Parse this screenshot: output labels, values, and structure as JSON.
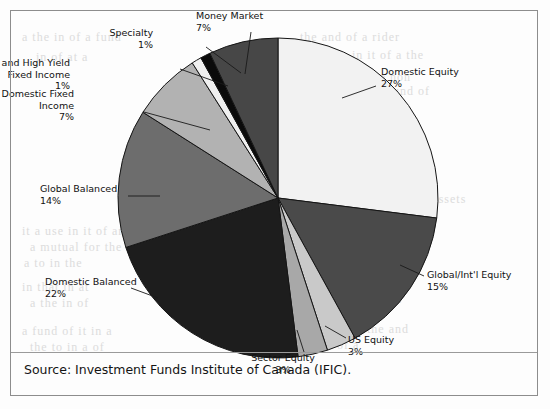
{
  "figure": {
    "source_caption": "Source: Investment Funds Institute of Canada (IFIC).",
    "background_color": "#fdfdfd",
    "frame_color": "#8d8d8d",
    "text_color": "#111111"
  },
  "bleed_text": [
    {
      "text": "the and of a rider",
      "x": 300,
      "y": 30
    },
    {
      "text": "in it of a the",
      "x": 352,
      "y": 48
    },
    {
      "text": "for it and a the non",
      "x": 300,
      "y": 70
    },
    {
      "text": "it the a mutual fund of",
      "x": 300,
      "y": 84
    },
    {
      "text": "the non and are",
      "x": 310,
      "y": 98
    },
    {
      "text": "able of in a an to",
      "x": 300,
      "y": 118
    },
    {
      "text": "that of a mutual funds",
      "x": 300,
      "y": 132
    },
    {
      "text": "a mutual of to a the",
      "x": 296,
      "y": 152
    },
    {
      "text": "a and the in of an",
      "x": 300,
      "y": 166
    },
    {
      "text": "Figure 1 Mutual Fund Assets",
      "x": 300,
      "y": 192
    },
    {
      "text": "in the for a year in",
      "x": 300,
      "y": 206
    },
    {
      "text": "with a percent",
      "x": 300,
      "y": 226
    },
    {
      "text": "for a funds the",
      "x": 300,
      "y": 240
    },
    {
      "text": "a mutual of",
      "x": 300,
      "y": 254
    },
    {
      "text": "in a the",
      "x": 310,
      "y": 268
    },
    {
      "text": "sample funds of a",
      "x": 300,
      "y": 292
    },
    {
      "text": "in that in the",
      "x": 300,
      "y": 306
    },
    {
      "text": "a fund at of the and",
      "x": 296,
      "y": 322
    },
    {
      "text": "the in of a",
      "x": 300,
      "y": 338
    },
    {
      "text": "it a use in it of an",
      "x": 22,
      "y": 224
    },
    {
      "text": "a mutual for the",
      "x": 30,
      "y": 240
    },
    {
      "text": "a to in the",
      "x": 24,
      "y": 256
    },
    {
      "text": "in that in at",
      "x": 22,
      "y": 280
    },
    {
      "text": "a the in of",
      "x": 30,
      "y": 296
    },
    {
      "text": "a fund of it in a",
      "x": 22,
      "y": 324
    },
    {
      "text": "the to in a of",
      "x": 30,
      "y": 340
    },
    {
      "text": "a the in of a fund",
      "x": 22,
      "y": 30
    },
    {
      "text": "in of at a",
      "x": 36,
      "y": 50
    }
  ],
  "chart_data": {
    "type": "pie",
    "title": "",
    "legend_position": "labels-with-leader-lines",
    "total": 100,
    "units": "percent",
    "start_angle_deg": 0,
    "direction": "clockwise",
    "center": {
      "x": 278,
      "y": 198
    },
    "radius": 160,
    "categories": [
      "Domestic Equity",
      "Global/Int'l Equity",
      "US Equity",
      "Sector Equity",
      "Domestic Balanced",
      "Global Balanced",
      "Domestic Fixed Income",
      "Global and High Yield Fixed Income",
      "Specialty",
      "Money Market"
    ],
    "values": [
      27,
      15,
      3,
      3,
      22,
      14,
      7,
      1,
      1,
      7
    ],
    "colors": [
      "#f2f2f2",
      "#4a4a4a",
      "#c9c9c9",
      "#a8a8a8",
      "#1d1d1d",
      "#6d6d6d",
      "#b2b2b2",
      "#f0f0f0",
      "#0a0a0a",
      "#474747"
    ],
    "slices": [
      {
        "name": "Domestic Equity",
        "label": "Domestic Equity",
        "percent_label": "27%",
        "value": 27,
        "color": "#f2f2f2",
        "start_deg": 0,
        "end_deg": 97.2,
        "label_pos": {
          "x": 381,
          "y": 66
        },
        "align": "left",
        "leader": {
          "x1": 376,
          "y1": 86,
          "x2": 342,
          "y2": 98
        }
      },
      {
        "name": "Global/Int'l Equity",
        "label": "Global/Int'l Equity",
        "percent_label": "15%",
        "value": 15,
        "color": "#4a4a4a",
        "start_deg": 97.2,
        "end_deg": 151.2,
        "label_pos": {
          "x": 427,
          "y": 269
        },
        "align": "left",
        "leader": {
          "x1": 424,
          "y1": 276,
          "x2": 400,
          "y2": 265
        }
      },
      {
        "name": "US Equity",
        "label": "US Equity",
        "percent_label": "3%",
        "value": 3,
        "color": "#c9c9c9",
        "start_deg": 151.2,
        "end_deg": 162,
        "label_pos": {
          "x": 348,
          "y": 334
        },
        "align": "left",
        "leader": {
          "x1": 346,
          "y1": 338,
          "x2": 325,
          "y2": 326
        }
      },
      {
        "name": "Sector Equity",
        "label": "Sector Equity",
        "percent_label": "3%",
        "value": 3,
        "color": "#a8a8a8",
        "start_deg": 162,
        "end_deg": 172.8,
        "label_pos": {
          "x": 283,
          "y": 352
        },
        "align": "center",
        "leader": {
          "x1": 304,
          "y1": 352,
          "x2": 297,
          "y2": 330
        }
      },
      {
        "name": "Domestic Balanced",
        "label": "Domestic Balanced",
        "percent_label": "22%",
        "value": 22,
        "color": "#1d1d1d",
        "start_deg": 172.8,
        "end_deg": 252,
        "label_pos": {
          "x": 45,
          "y": 276
        },
        "align": "left",
        "leader": {
          "x1": 131,
          "y1": 288,
          "x2": 158,
          "y2": 298
        }
      },
      {
        "name": "Global Balanced",
        "label": "Global Balanced",
        "percent_label": "14%",
        "value": 14,
        "color": "#6d6d6d",
        "start_deg": 252,
        "end_deg": 302.4,
        "label_pos": {
          "x": 40,
          "y": 183
        },
        "align": "left",
        "leader": {
          "x1": 128,
          "y1": 196,
          "x2": 160,
          "y2": 196
        }
      },
      {
        "name": "Domestic Fixed Income",
        "label": "Domestic Fixed\nIncome",
        "label_line1": "Domestic Fixed",
        "label_line2": "Income",
        "percent_label": "7%",
        "value": 7,
        "color": "#b2b2b2",
        "label_pos": {
          "x": 74,
          "y": 88
        },
        "align": "right",
        "leader": {
          "x1": 144,
          "y1": 112,
          "x2": 210,
          "y2": 130
        },
        "start_deg": 302.4,
        "end_deg": 327.6
      },
      {
        "name": "Global and High Yield Fixed Income",
        "label_line1": "Global and High Yield",
        "label_line2": "Fixed Income",
        "percent_label": "1%",
        "value": 1,
        "color": "#f0f0f0",
        "label_pos": {
          "x": 70,
          "y": 57
        },
        "align": "right",
        "leader": {
          "x1": 180,
          "y1": 69,
          "x2": 228,
          "y2": 86
        },
        "start_deg": 327.6,
        "end_deg": 331.2
      },
      {
        "name": "Specialty",
        "label": "Specialty",
        "percent_label": "1%",
        "value": 1,
        "color": "#0a0a0a",
        "label_pos": {
          "x": 153,
          "y": 27
        },
        "align": "right",
        "leader": {
          "x1": 206,
          "y1": 47,
          "x2": 241,
          "y2": 73
        },
        "start_deg": 331.2,
        "end_deg": 334.8
      },
      {
        "name": "Money Market",
        "label": "Money Market",
        "percent_label": "7%",
        "value": 7,
        "color": "#474747",
        "label_pos": {
          "x": 196,
          "y": 10
        },
        "align": "left",
        "leader": {
          "x1": 251,
          "y1": 32,
          "x2": 245,
          "y2": 74
        },
        "start_deg": 334.8,
        "end_deg": 360
      }
    ]
  }
}
